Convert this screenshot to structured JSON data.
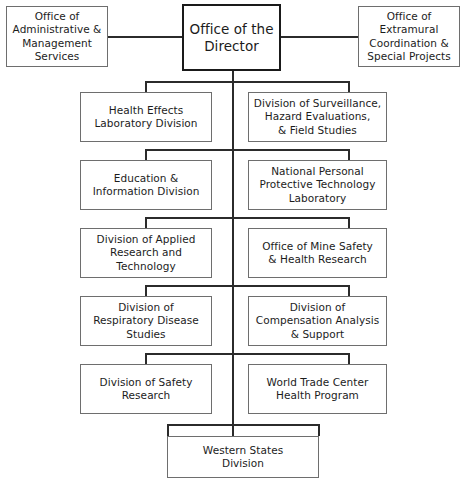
{
  "chart_title": "NIOSH Organizational Chart",
  "style": {
    "background": "#ffffff",
    "box_border": "#6e6e6e",
    "root_border": "#1a1a1a",
    "line_color": "#2b2b2b",
    "text_color": "#1c1c1c"
  },
  "root": {
    "label": "Office of the\nDirector"
  },
  "staff_offices": [
    {
      "label": "Office of\nAdministrative &\nManagement\nServices",
      "side": "left"
    },
    {
      "label": "Office of\nExtramural\nCoordination &\nSpecial Projects",
      "side": "right"
    }
  ],
  "rows": [
    {
      "left": {
        "label": "Health Effects\nLaboratory Division"
      },
      "right": {
        "label": "Division of Surveillance,\nHazard Evaluations,\n& Field Studies"
      }
    },
    {
      "left": {
        "label": "Education &\nInformation Division"
      },
      "right": {
        "label": "National Personal\nProtective Technology\nLaboratory"
      }
    },
    {
      "left": {
        "label": "Division of Applied\nResearch and Technology"
      },
      "right": {
        "label": "Office of Mine Safety\n& Health Research"
      }
    },
    {
      "left": {
        "label": "Division of\nRespiratory Disease\nStudies"
      },
      "right": {
        "label": "Division of\nCompensation Analysis\n& Support"
      }
    },
    {
      "left": {
        "label": "Division of Safety\nResearch"
      },
      "right": {
        "label": "World Trade Center\nHealth Program"
      }
    }
  ],
  "bottom": {
    "label": "Western States\nDivision"
  }
}
